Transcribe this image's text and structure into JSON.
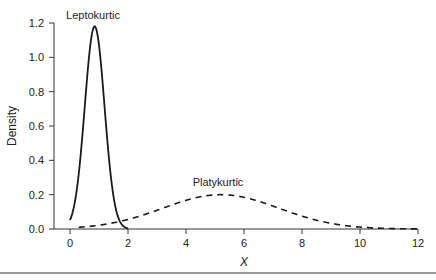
{
  "chart_data": {
    "type": "line",
    "title": "",
    "xlabel": "X",
    "ylabel": "Density",
    "xlim": [
      0,
      12
    ],
    "ylim": [
      0,
      1.2
    ],
    "x_ticks": [
      0,
      2,
      4,
      6,
      8,
      10,
      12
    ],
    "x_tick_labels": [
      "0",
      "2",
      "4",
      "6",
      "8",
      "10",
      "12"
    ],
    "y_ticks": [
      0.0,
      0.2,
      0.4,
      0.6,
      0.8,
      1.0,
      1.2
    ],
    "y_tick_labels": [
      "0.0",
      "0.2",
      "0.4",
      "0.6",
      "0.8",
      "1.0",
      "1.2"
    ],
    "grid": false,
    "legend": null,
    "series": [
      {
        "name": "Leptokurtic",
        "style": "solid",
        "distribution": "normal",
        "mean": 0.85,
        "sd": 0.34,
        "peak_density": 1.18,
        "x": [
          0,
          0.2,
          0.4,
          0.6,
          0.85,
          1.1,
          1.3,
          1.5,
          1.7,
          1.9,
          2.1
        ],
        "values": [
          0.05,
          0.19,
          0.49,
          0.9,
          1.18,
          0.9,
          0.49,
          0.19,
          0.05,
          0.01,
          0.0
        ]
      },
      {
        "name": "Platykurtic",
        "style": "dashed",
        "distribution": "normal",
        "mean": 5.2,
        "sd": 2.0,
        "peak_density": 0.2,
        "x": [
          0,
          1,
          2,
          3,
          4,
          5,
          6,
          7,
          8,
          9,
          10,
          11,
          12
        ],
        "values": [
          0.007,
          0.022,
          0.056,
          0.109,
          0.166,
          0.199,
          0.184,
          0.134,
          0.075,
          0.033,
          0.011,
          0.003,
          0.001
        ]
      }
    ],
    "annotations": [
      {
        "text": "Leptokurtic",
        "x": 0.85,
        "y": 1.24
      },
      {
        "text": "Platykurtic",
        "x": 5.2,
        "y": 0.245
      }
    ]
  },
  "labels": {
    "xlabel": "X",
    "ylabel": "Density",
    "lepto": "Leptokurtic",
    "platy": "Platykurtic"
  },
  "colors": {
    "line": "#1a1a1a",
    "axis": "#333333"
  }
}
